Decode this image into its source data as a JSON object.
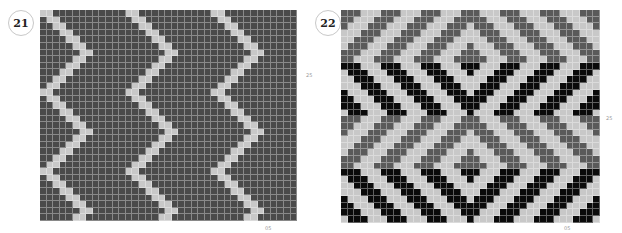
{
  "panels": [
    {
      "number": "21",
      "side_label": "25",
      "bottom_label": "05",
      "grid": {
        "cols": 39,
        "rows": 32,
        "cell": 6.6,
        "left": 40,
        "top": 10,
        "pattern": "vertical-zigzag",
        "period": 13,
        "stripe_width": 2,
        "zig_length": 6,
        "colors": {
          "background": "#4a4a4a",
          "stripe": "#c8c8c8"
        }
      }
    },
    {
      "number": "22",
      "side_label": "25",
      "bottom_label": "05",
      "grid": {
        "cols": 39,
        "rows": 32,
        "cell": 6.65,
        "left": 341,
        "top": 10,
        "pattern": "horizontal-chevron-bands",
        "period": 6,
        "stripe_width": 3,
        "band_height": 8,
        "colors": {
          "background": "#c8c8c8",
          "stripe_gray": "#5a5a5a",
          "stripe_black": "#0a0a0a"
        }
      }
    }
  ]
}
